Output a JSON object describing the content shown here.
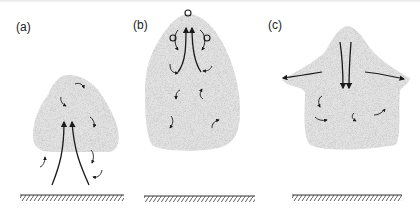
{
  "figure": {
    "panels": [
      {
        "id": "a",
        "label": "(a)",
        "description": "Rising thermal plume with strong central updraft and small eddies"
      },
      {
        "id": "b",
        "label": "(b)",
        "description": "Mature cloud with updraft reaching top, entraining eddies and rising bubbles"
      },
      {
        "id": "c",
        "label": "(c)",
        "description": "Dissipating cloud with downdraft and lateral outflow"
      }
    ],
    "colors": {
      "cloud_fill": "#d9d9d9",
      "arrows": "#1a1a1a",
      "ground": "#333333",
      "background": "#ffffff"
    },
    "icons": {
      "updraft": "arrow-up-icon",
      "downdraft": "arrow-down-icon",
      "eddy": "curved-arrow-icon",
      "bubble": "circle-icon",
      "ground": "hatched-ground-icon"
    }
  }
}
